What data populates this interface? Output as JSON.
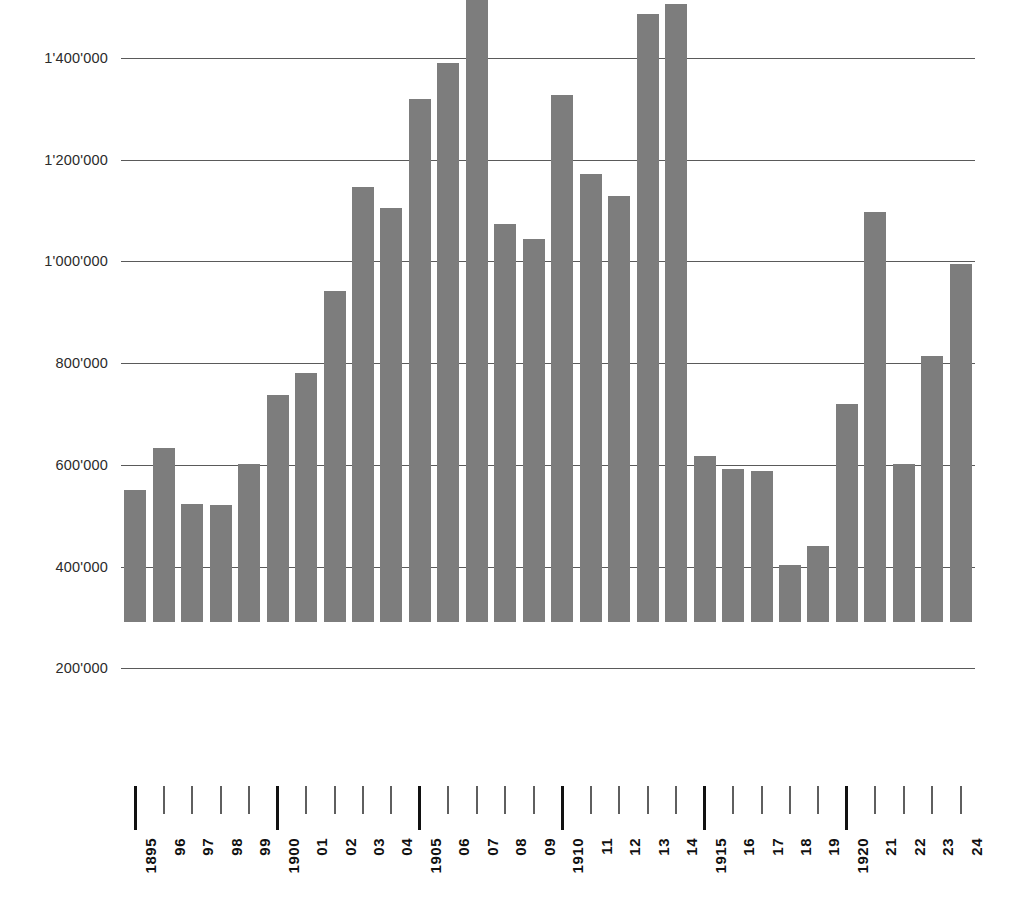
{
  "chart_data": {
    "type": "bar",
    "title": "",
    "subtitle": "",
    "xlabel": "",
    "ylabel": "",
    "grid": true,
    "legend": "none",
    "bar_color": "#7d7d7d",
    "gridline_color": "#5a5a5a",
    "axis_text_color": "#111111",
    "ylim": [
      0,
      1400000
    ],
    "ytick_values": [
      200000,
      400000,
      600000,
      800000,
      1000000,
      1200000,
      1400000
    ],
    "ytick_labels": [
      "200'000",
      "400'000",
      "600'000",
      "800'000",
      "1'000'000",
      "1'200'000",
      "1'400'000"
    ],
    "thousands_separator": "'",
    "categories": [
      "1895",
      "96",
      "97",
      "98",
      "99",
      "1900",
      "01",
      "02",
      "03",
      "04",
      "1905",
      "06",
      "07",
      "08",
      "09",
      "1910",
      "11",
      "12",
      "13",
      "14",
      "1915",
      "16",
      "17",
      "18",
      "19",
      "1920",
      "21",
      "22",
      "23",
      "24"
    ],
    "full_years": [
      1895,
      1896,
      1897,
      1898,
      1899,
      1900,
      1901,
      1902,
      1903,
      1904,
      1905,
      1906,
      1907,
      1908,
      1909,
      1910,
      1911,
      1912,
      1913,
      1914,
      1915,
      1916,
      1917,
      1918,
      1919,
      1920,
      1921,
      1922,
      1923,
      1924
    ],
    "major_ticks": [
      "1895",
      "1900",
      "1905",
      "1910",
      "1915",
      "1920"
    ],
    "values": [
      260000,
      343000,
      233000,
      231000,
      311000,
      446000,
      490000,
      651000,
      856000,
      814000,
      1028000,
      1100000,
      1286000,
      782000,
      753000,
      1037000,
      880000,
      837000,
      1196000,
      1215000,
      327000,
      301000,
      297000,
      113000,
      150000,
      428000,
      807000,
      310000,
      524000,
      704000
    ]
  }
}
